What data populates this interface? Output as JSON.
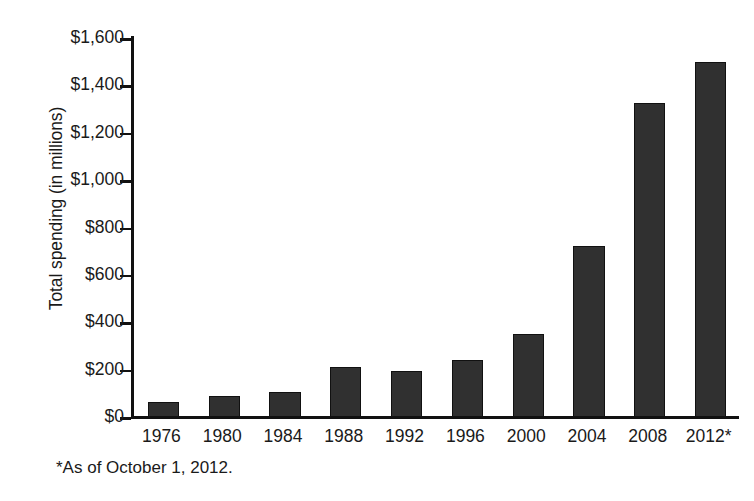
{
  "chart_data": {
    "type": "bar",
    "title": "",
    "xlabel": "",
    "ylabel": "Total spending (in millions)",
    "categories": [
      "1976",
      "1980",
      "1984",
      "1988",
      "1992",
      "1996",
      "2000",
      "2004",
      "2008",
      "2012*"
    ],
    "values": [
      65,
      90,
      105,
      212,
      195,
      240,
      350,
      720,
      1325,
      1500
    ],
    "ylim": [
      0,
      1600
    ],
    "ytick_values": [
      0,
      200,
      400,
      600,
      800,
      1000,
      1200,
      1400,
      1600
    ],
    "ytick_labels": [
      "$0",
      "$200",
      "$400",
      "$600",
      "$800",
      "$1,000",
      "$1,200",
      "$1,400",
      "$1,600"
    ],
    "grid": false,
    "legend": "none",
    "footnote": "*As of October 1, 2012.",
    "bar_color": "#303030",
    "axis_color": "#111111",
    "background_color": "#ffffff"
  }
}
